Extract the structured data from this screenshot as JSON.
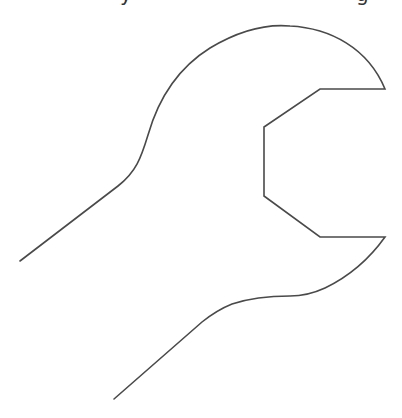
{
  "caption": {
    "visible_fragments": [
      "y",
      "g"
    ],
    "note_text": "",
    "color": "#333333"
  },
  "figure": {
    "icon": "wrench-icon",
    "stroke_color": "#4a4a4a",
    "fill_color": "#ffffff"
  }
}
